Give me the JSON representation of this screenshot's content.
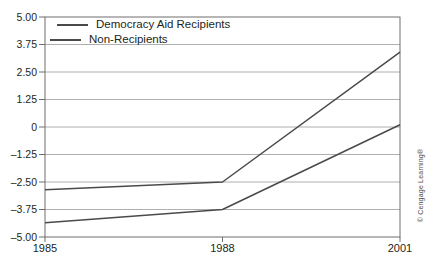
{
  "figure": {
    "copyright": "© Cengage Learning®"
  },
  "chart_data": {
    "type": "line",
    "categories": [
      "1985",
      "1988",
      "2001"
    ],
    "series": [
      {
        "name": "Democracy Aid Recipients",
        "values": [
          -2.85,
          -2.5,
          3.4
        ],
        "color": "#4a4a4c"
      },
      {
        "name": "Non-Recipients",
        "values": [
          -4.35,
          -3.75,
          0.1
        ],
        "color": "#4a4a4c"
      }
    ],
    "title": "",
    "xlabel": "",
    "ylabel": "",
    "ylim": [
      -5,
      5
    ],
    "yticks": {
      "values": [
        5,
        3.75,
        2.5,
        1.25,
        0,
        -1.25,
        -2.5,
        -3.75,
        -5
      ],
      "labels": [
        "5.00",
        "3.75",
        "2.50",
        "1.25",
        "0",
        "–1.25",
        "–2.50",
        "–3.75",
        "–5.00"
      ]
    },
    "grid": true,
    "legend_position": "top-left-inside",
    "style": {
      "line_width": 1.5,
      "gridline_color": "#9b9b9d",
      "frame_color": "#6f6f71",
      "tick_text_color": "#231f20"
    }
  }
}
